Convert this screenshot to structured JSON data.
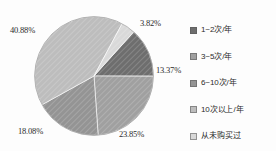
{
  "chart_data": {
    "type": "pie",
    "title": "",
    "subtitle": "",
    "xlabel": "",
    "ylabel": "",
    "grid": false,
    "legend_position": "right",
    "categories": [
      "1~2次/年",
      "3~5次/年",
      "6~10次/年",
      "10次以上/年",
      "从未购买过"
    ],
    "values": [
      13.37,
      23.85,
      18.08,
      40.88,
      3.82
    ],
    "value_labels": [
      "13.37%",
      "23.85%",
      "18.08%",
      "40.88%",
      "3.82%"
    ],
    "colors": [
      "#6e6e6e",
      "#a0a0a0",
      "#949494",
      "#bdbdbd",
      "#d9d9d9"
    ],
    "units": "%",
    "start_angle_deg": -48,
    "direction": "clockwise"
  },
  "pie": {
    "slices": [
      {
        "label": "1~2次/年",
        "value": 13.37,
        "display": "13.37%",
        "color": "#6e6e6e"
      },
      {
        "label": "3~5次/年",
        "value": 23.85,
        "display": "23.85%",
        "color": "#a0a0a0"
      },
      {
        "label": "6~10次/年",
        "value": 18.08,
        "display": "18.08%",
        "color": "#949494"
      },
      {
        "label": "10次以上/年",
        "value": 40.88,
        "display": "40.88%",
        "color": "#bdbdbd"
      },
      {
        "label": "从未购买过",
        "value": 3.82,
        "display": "3.82%",
        "color": "#d9d9d9"
      }
    ]
  },
  "labels": {
    "pct_0": "3.82%",
    "pct_1": "13.37%",
    "pct_2": "23.85%",
    "pct_3": "18.08%",
    "pct_4": "40.88%"
  },
  "legend": {
    "items": [
      {
        "label": "1~2次/年",
        "color": "#6e6e6e"
      },
      {
        "label": "3~5次/年",
        "color": "#a0a0a0"
      },
      {
        "label": "6~10次/年",
        "color": "#949494"
      },
      {
        "label": "10次以上/年",
        "color": "#bdbdbd"
      },
      {
        "label": "从未购买过",
        "color": "#d9d9d9"
      }
    ]
  }
}
